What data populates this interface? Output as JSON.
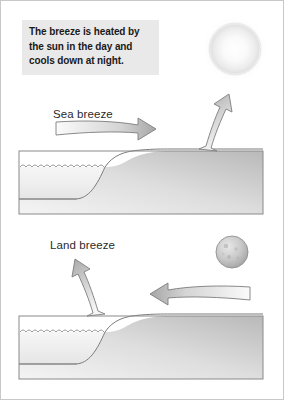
{
  "figure": {
    "caption": "The breeze is heated by the sun in the day and cools down at night.",
    "caption_lines": [
      "The breeze is heated by",
      "the sun in the day and",
      "cools down at night."
    ]
  },
  "panels": [
    {
      "id": "day",
      "label": "Sea breeze",
      "celestial_body": "sun",
      "horizontal_arrow_direction": "right",
      "vertical_arrow_direction": "up"
    },
    {
      "id": "night",
      "label": "Land breeze",
      "celestial_body": "moon",
      "horizontal_arrow_direction": "left",
      "vertical_arrow_direction": "up"
    }
  ],
  "icons": {
    "sun": "sun-icon",
    "moon": "moon-icon",
    "arrow_right": "arrow-right-icon",
    "arrow_left": "arrow-left-icon",
    "arrow_up": "arrow-up-icon",
    "water": "water-surface-icon",
    "land": "land-terrain-icon"
  },
  "colors": {
    "page_background": "#ffffff",
    "frame_border": "#c8c8c8",
    "caption_background": "#e9e9e9",
    "caption_text": "#1a1a1a",
    "label_text": "#2b2b2b",
    "terrain_outline": "#6e6e6e",
    "water_light": "#fafafa",
    "water_dark": "#d5d5d5",
    "land_light": "#e4e4e4",
    "land_dark": "#b4b4b4",
    "arrow_outline": "#7a7a7a",
    "arrow_light": "#f2f2f2",
    "arrow_dark": "#9a9a9a",
    "sun_glow": "#f0f0f0",
    "moon_body": "#c4c4c4"
  }
}
